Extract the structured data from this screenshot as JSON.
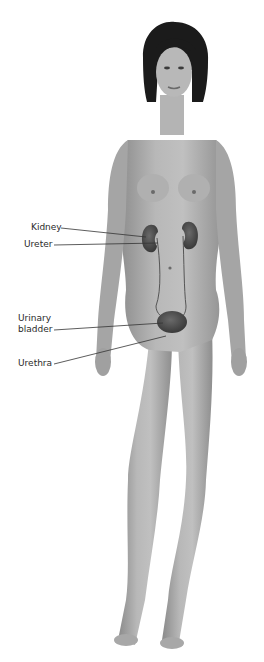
{
  "diagram": {
    "colors": {
      "background": "#ffffff",
      "skin_light": "#bdbdbd",
      "skin_mid": "#9d9d9d",
      "skin_dark": "#777777",
      "hair": "#1b1b1b",
      "organ": "#4a4a4a",
      "leader_line": "#333333",
      "label_text": "#2a2a2a"
    },
    "labels": [
      {
        "id": "kidney",
        "text": "Kidney"
      },
      {
        "id": "ureter",
        "text": "Ureter"
      },
      {
        "id": "urinary-bladder",
        "text": "Urinary\nbladder"
      },
      {
        "id": "urethra",
        "text": "Urethra"
      }
    ]
  }
}
